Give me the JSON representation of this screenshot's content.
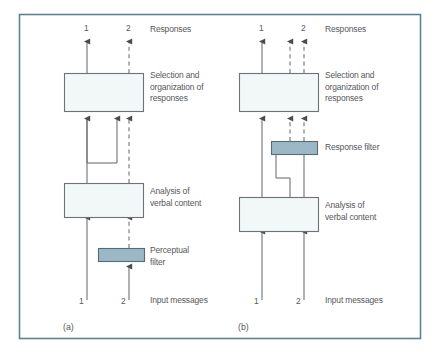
{
  "figure": {
    "frame_color": "#5b8490",
    "background": "#ffffff",
    "line_color": "#6e7275",
    "text_color": "#57585a",
    "box_fill": "#f2f7f7",
    "box_stroke": "#6e7275",
    "filter_fill": "#9ab8c6",
    "filter_stroke": "#5a6a72"
  },
  "panels": [
    {
      "id": "a",
      "caption": "(a)",
      "top_numbers": [
        "1",
        "2"
      ],
      "bottom_numbers": [
        "1",
        "2"
      ],
      "top_label": "Responses",
      "bottom_label": "Input messages",
      "boxes": [
        {
          "name": "selection-box",
          "label": "Selection and\norganization of\nresponses"
        },
        {
          "name": "analysis-box",
          "label": "Analysis of\nverbal content"
        },
        {
          "name": "filter-box",
          "label": "Perceptual\nfilter"
        }
      ]
    },
    {
      "id": "b",
      "caption": "(b)",
      "top_numbers": [
        "1",
        "2"
      ],
      "bottom_numbers": [
        "1",
        "2"
      ],
      "top_label": "Responses",
      "bottom_label": "Input messages",
      "boxes": [
        {
          "name": "selection-box",
          "label": "Selection and\norganization of\nresponses"
        },
        {
          "name": "filter-box",
          "label": "Response filter"
        },
        {
          "name": "analysis-box",
          "label": "Analysis of\nverbal content"
        }
      ]
    }
  ],
  "labels": {
    "a_top_num_1": "1",
    "a_top_num_2": "2",
    "a_responses": "Responses",
    "a_selection": "Selection and\norganization of\nresponses",
    "a_analysis": "Analysis of\nverbal content",
    "a_filter": "Perceptual\nfilter",
    "a_bottom_num_1": "1",
    "a_bottom_num_2": "2",
    "a_input": "Input messages",
    "a_caption": "(a)",
    "b_top_num_1": "1",
    "b_top_num_2": "2",
    "b_responses": "Responses",
    "b_selection": "Selection and\norganization of\nresponses",
    "b_filter": "Response filter",
    "b_analysis": "Analysis of\nverbal content",
    "b_bottom_num_1": "1",
    "b_bottom_num_2": "2",
    "b_input": "Input messages",
    "b_caption": "(b)"
  }
}
